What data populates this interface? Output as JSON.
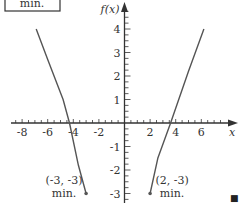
{
  "chart_data": {
    "type": "line",
    "title": "",
    "xlabel": "x",
    "ylabel": "f(x)",
    "xlim": [
      -9,
      8.7
    ],
    "ylim": [
      -3.4,
      5
    ],
    "grid": false,
    "x_ticks": [
      -8,
      -6,
      -4,
      -2,
      2,
      4,
      6
    ],
    "x_tick_labels": [
      "-8",
      "-6",
      "-4",
      "-2",
      "2",
      "4",
      "6"
    ],
    "x_minor_step": 0.5,
    "y_ticks": [
      4,
      3,
      2,
      1,
      -1,
      -2,
      -3
    ],
    "y_tick_labels": [
      "4",
      "3",
      "2",
      "1",
      "-1",
      "-2",
      "-3"
    ],
    "y_minor_step": 0.25,
    "series": [
      {
        "name": "left-branch",
        "x": [
          -6.9,
          -6.0,
          -4.8,
          -4.3,
          -3.6,
          -3.0
        ],
        "y": [
          4.0,
          2.7,
          1.0,
          0.0,
          -1.8,
          -3.0
        ]
      },
      {
        "name": "right-branch",
        "x": [
          2.0,
          2.6,
          3.6,
          5.0,
          6.2
        ],
        "y": [
          -3.0,
          -1.5,
          0.0,
          2.2,
          4.0
        ]
      }
    ],
    "points": [
      {
        "x": -3,
        "y": -3,
        "label": "(-3, -3)",
        "sublabel": "min."
      },
      {
        "x": 2,
        "y": -3,
        "label": "(2, -3)",
        "sublabel": "min."
      }
    ],
    "color": "#555555"
  },
  "boxed_note": "min.",
  "end_mark": "■"
}
